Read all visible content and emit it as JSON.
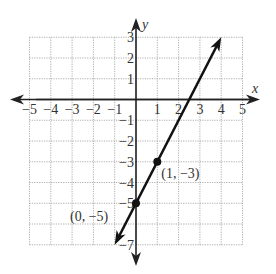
{
  "chart_data": {
    "type": "line",
    "title": "",
    "xlabel": "x",
    "ylabel": "y",
    "xlim": [
      -5,
      5
    ],
    "ylim": [
      -7,
      3
    ],
    "grid": true,
    "x_ticks": [
      "−5",
      "−4",
      "−3",
      "−2",
      "−1",
      "1",
      "2",
      "3",
      "4",
      "5"
    ],
    "y_ticks": [
      "3",
      "2",
      "1",
      "−1",
      "−2",
      "−3",
      "−4",
      "−5",
      "−7"
    ],
    "series": [
      {
        "name": "y = 2x − 5",
        "x": [
          -1,
          4
        ],
        "y": [
          -7,
          3
        ]
      }
    ],
    "points": [
      {
        "x": 1,
        "y": -3,
        "label": "(1, −3)"
      },
      {
        "x": 0,
        "y": -5,
        "label": "(0, −5)"
      }
    ]
  }
}
